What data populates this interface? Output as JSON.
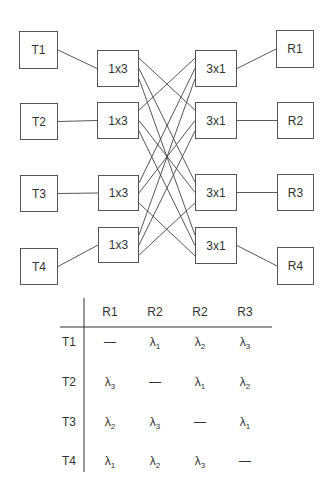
{
  "diagram": {
    "transmitters": [
      {
        "id": "T1",
        "label": "T1",
        "x": 19,
        "y": 31,
        "w": 39,
        "h": 38
      },
      {
        "id": "T2",
        "label": "T2",
        "x": 20,
        "y": 103,
        "w": 38,
        "h": 37
      },
      {
        "id": "T3",
        "label": "T3",
        "x": 20,
        "y": 175,
        "w": 38,
        "h": 37
      },
      {
        "id": "T4",
        "label": "T4",
        "x": 20,
        "y": 248,
        "w": 38,
        "h": 37
      }
    ],
    "splitters": [
      {
        "id": "S1",
        "label": "1x3",
        "x": 97,
        "y": 50,
        "w": 42,
        "h": 37
      },
      {
        "id": "S2",
        "label": "1x3",
        "x": 97,
        "y": 102,
        "w": 42,
        "h": 37
      },
      {
        "id": "S3",
        "label": "1x3",
        "x": 98,
        "y": 175,
        "w": 41,
        "h": 36
      },
      {
        "id": "S4",
        "label": "1x3",
        "x": 98,
        "y": 227,
        "w": 41,
        "h": 36
      }
    ],
    "combiners": [
      {
        "id": "C1",
        "label": "3x1",
        "x": 195,
        "y": 50,
        "w": 42,
        "h": 37
      },
      {
        "id": "C2",
        "label": "3x1",
        "x": 195,
        "y": 102,
        "w": 42,
        "h": 37
      },
      {
        "id": "C3",
        "label": "3x1",
        "x": 195,
        "y": 174,
        "w": 42,
        "h": 37
      },
      {
        "id": "C4",
        "label": "3x1",
        "x": 195,
        "y": 227,
        "w": 42,
        "h": 37
      }
    ],
    "receivers": [
      {
        "id": "R1",
        "label": "R1",
        "x": 276,
        "y": 30,
        "w": 38,
        "h": 38
      },
      {
        "id": "R2",
        "label": "R2",
        "x": 277,
        "y": 102,
        "w": 37,
        "h": 37
      },
      {
        "id": "R3",
        "label": "R3",
        "x": 277,
        "y": 174,
        "w": 37,
        "h": 37
      },
      {
        "id": "R4",
        "label": "R4",
        "x": 277,
        "y": 247,
        "w": 37,
        "h": 38
      }
    ],
    "links": [
      {
        "from": "T1",
        "to": "S1"
      },
      {
        "from": "T2",
        "to": "S2"
      },
      {
        "from": "T3",
        "to": "S3"
      },
      {
        "from": "T4",
        "to": "S4"
      },
      {
        "from": "C1",
        "to": "R1"
      },
      {
        "from": "C2",
        "to": "R2"
      },
      {
        "from": "C3",
        "to": "R3"
      },
      {
        "from": "C4",
        "to": "R4"
      }
    ],
    "mesh": [
      {
        "from": "S1",
        "to": [
          "C2",
          "C3",
          "C4"
        ]
      },
      {
        "from": "S2",
        "to": [
          "C1",
          "C3",
          "C4"
        ]
      },
      {
        "from": "S3",
        "to": [
          "C1",
          "C2",
          "C4"
        ]
      },
      {
        "from": "S4",
        "to": [
          "C1",
          "C2",
          "C3"
        ]
      }
    ],
    "line_color": "#444444"
  },
  "table": {
    "columns": [
      "R1",
      "R2",
      "R2",
      "R3"
    ],
    "rows": [
      {
        "label": "T1",
        "cells": [
          "—",
          "λ1",
          "λ2",
          "λ3"
        ]
      },
      {
        "label": "T2",
        "cells": [
          "λ3",
          "—",
          "λ1",
          "λ2"
        ]
      },
      {
        "label": "T3",
        "cells": [
          "λ2",
          "λ3",
          "—",
          "λ1"
        ]
      },
      {
        "label": "T4",
        "cells": [
          "λ1",
          "λ2",
          "λ3",
          "—"
        ]
      }
    ]
  }
}
